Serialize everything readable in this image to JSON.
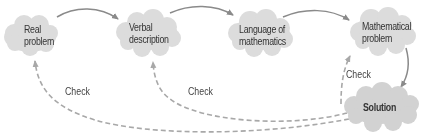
{
  "diagram": {
    "nodes": [
      {
        "id": "real-problem",
        "lines": [
          "Real",
          "problem"
        ]
      },
      {
        "id": "verbal-description",
        "lines": [
          "Verbal",
          "description"
        ]
      },
      {
        "id": "language-of-mathematics",
        "lines": [
          "Language of",
          "mathematics"
        ]
      },
      {
        "id": "mathematical-problem",
        "lines": [
          "Mathematical",
          "problem"
        ]
      },
      {
        "id": "solution",
        "lines": [
          "Solution"
        ]
      }
    ],
    "check_labels": [
      "Check",
      "Check",
      "Check"
    ],
    "colors": {
      "cloud_fill": "#dcdcdc",
      "solid_arrow": "#8a8a8a",
      "dashed_arrow": "#a0a0a0",
      "text": "#333333"
    }
  }
}
